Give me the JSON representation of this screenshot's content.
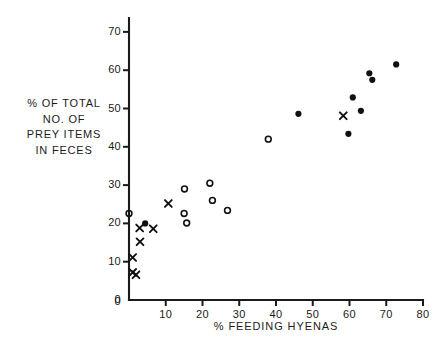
{
  "chart_data": {
    "type": "scatter",
    "title": "",
    "xlabel": "% FEEDING  HYENAS",
    "ylabel": "% OF TOTAL NO. OF PREY ITEMS IN FECES",
    "ylabel_lines": [
      "% OF  TOTAL",
      "NO. OF",
      "PREY  ITEMS",
      "IN  FECES"
    ],
    "xlim": [
      0,
      80
    ],
    "ylim": [
      0,
      75
    ],
    "xticks": [
      0,
      10,
      20,
      30,
      40,
      50,
      60,
      70,
      80
    ],
    "xticklabels": [
      "0",
      "10",
      "20",
      "30",
      "40",
      "50",
      "60",
      "70",
      "80"
    ],
    "yticks": [
      0,
      10,
      20,
      30,
      40,
      50,
      60,
      70
    ],
    "yticklabels": [
      "0",
      "10",
      "20",
      "30",
      "40",
      "50",
      "60",
      "70"
    ],
    "grid": false,
    "legend": "none",
    "axis_color": "#1a1a1a",
    "series": [
      {
        "name": "filled-circle",
        "marker": "filled-circle",
        "color": "#111111",
        "points": [
          {
            "x": 4.4,
            "y": 20.0
          },
          {
            "x": 46.1,
            "y": 48.6
          },
          {
            "x": 59.7,
            "y": 43.4
          },
          {
            "x": 60.9,
            "y": 52.9
          },
          {
            "x": 63.1,
            "y": 49.4
          },
          {
            "x": 65.4,
            "y": 59.2
          },
          {
            "x": 66.2,
            "y": 57.5
          },
          {
            "x": 72.7,
            "y": 61.5
          }
        ]
      },
      {
        "name": "open-circle",
        "marker": "open-circle",
        "color": "#111111",
        "points": [
          {
            "x": 0.0,
            "y": 22.6
          },
          {
            "x": 15.1,
            "y": 29.0
          },
          {
            "x": 15.0,
            "y": 22.6
          },
          {
            "x": 15.7,
            "y": 20.1
          },
          {
            "x": 22.0,
            "y": 30.5
          },
          {
            "x": 22.7,
            "y": 26.0
          },
          {
            "x": 26.8,
            "y": 23.4
          },
          {
            "x": 37.9,
            "y": 42.0
          }
        ]
      },
      {
        "name": "cross",
        "marker": "x",
        "color": "#111111",
        "points": [
          {
            "x": 1.0,
            "y": 7.2
          },
          {
            "x": 1.9,
            "y": 6.6
          },
          {
            "x": 1.0,
            "y": 11.1
          },
          {
            "x": 3.0,
            "y": 15.2
          },
          {
            "x": 2.9,
            "y": 18.8
          },
          {
            "x": 6.6,
            "y": 18.6
          },
          {
            "x": 10.7,
            "y": 25.2
          },
          {
            "x": 58.3,
            "y": 48.1
          }
        ]
      }
    ]
  },
  "plot": {
    "x0_px": 129,
    "y0_px": 300,
    "x_per_unit": 3.675,
    "y_per_unit": 3.83,
    "y_axis_top_px": 18,
    "x_axis_right_px": 423
  }
}
